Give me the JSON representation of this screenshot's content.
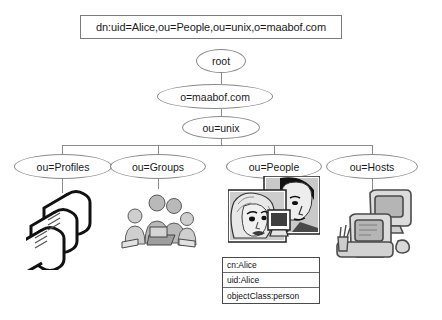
{
  "diagram": {
    "dn_box": {
      "label": "dn:uid=Alice,ou=People,ou=unix,o=maabof.com"
    },
    "nodes": {
      "root": "root",
      "org": "o=maabof.com",
      "unix": "ou=unix",
      "leaves": [
        {
          "label": "ou=Profiles",
          "art": "scrolls-illustration"
        },
        {
          "label": "ou=Groups",
          "art": "people-group-illustration"
        },
        {
          "label": "ou=People",
          "art": "portrait-photos-illustration"
        },
        {
          "label": "ou=Hosts",
          "art": "computers-illustration"
        }
      ]
    },
    "attribute_table": {
      "rows": [
        "cn:Alice",
        "uid:Alice",
        "objectClass:person"
      ]
    },
    "colors": {
      "background": "#ffffff",
      "line": "#8a8a8a",
      "box_border": "#7a7a7a",
      "table_border": "#4a4a4a",
      "text": "#1a1a1a"
    }
  }
}
